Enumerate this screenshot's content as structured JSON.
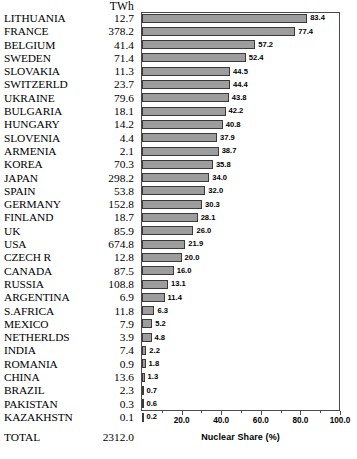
{
  "chart_data": {
    "type": "bar",
    "orientation": "horizontal",
    "title": "",
    "xlabel": "Nuclear Share (%)",
    "ylabel": "",
    "xlim": [
      0,
      100
    ],
    "xticks": [
      "20.0",
      "40.0",
      "60.0",
      "80.0",
      "100.0"
    ],
    "xtick_values": [
      20,
      40,
      60,
      80,
      100
    ],
    "grid": false,
    "legend": "none",
    "value_column_header": "TWh",
    "categories": [
      "LITHUANIA",
      "FRANCE",
      "BELGIUM",
      "SWEDEN",
      "SLOVAKIA",
      "SWITZERLD",
      "UKRAINE",
      "BULGARIA",
      "HUNGARY",
      "SLOVENIA",
      "ARMENIA",
      "KOREA",
      "JAPAN",
      "SPAIN",
      "GERMANY",
      "FINLAND",
      "UK",
      "USA",
      "CZECH  R",
      "CANADA",
      "RUSSIA",
      "ARGENTINA",
      "S.AFRICA",
      "MEXICO",
      "NETHERLDS",
      "INDIA",
      "ROMANIA",
      "CHINA",
      "BRAZIL",
      "PAKISTAN",
      "KAZAKHSTN"
    ],
    "twh": [
      "12.7",
      "378.2",
      "41.4",
      "71.4",
      "11.3",
      "23.7",
      "79.6",
      "18.1",
      "14.2",
      "4.4",
      "2.1",
      "70.3",
      "298.2",
      "53.8",
      "152.8",
      "18.7",
      "85.9",
      "674.8",
      "12.8",
      "87.5",
      "108.8",
      "6.9",
      "11.8",
      "7.9",
      "3.9",
      "7.4",
      "0.9",
      "13.6",
      "2.3",
      "0.3",
      "0.1"
    ],
    "twh_values": [
      12.7,
      378.2,
      41.4,
      71.4,
      11.3,
      23.7,
      79.6,
      18.1,
      14.2,
      4.4,
      2.1,
      70.3,
      298.2,
      53.8,
      152.8,
      18.7,
      85.9,
      674.8,
      12.8,
      87.5,
      108.8,
      6.9,
      11.8,
      7.9,
      3.9,
      7.4,
      0.9,
      13.6,
      2.3,
      0.3,
      0.1
    ],
    "values": [
      83.4,
      77.4,
      57.2,
      52.4,
      44.5,
      44.4,
      43.8,
      42.2,
      40.8,
      37.9,
      38.7,
      35.8,
      34.0,
      32.0,
      30.3,
      28.1,
      26.0,
      21.9,
      20.0,
      16.0,
      13.1,
      11.4,
      6.3,
      5.2,
      4.8,
      2.2,
      1.8,
      1.3,
      0.7,
      0.6,
      0.2
    ],
    "value_labels": [
      "83.4",
      "77.4",
      "57.2",
      "52.4",
      "44.5",
      "44.4",
      "43.8",
      "42.2",
      "40.8",
      "37.9",
      "38.7",
      "35.8",
      "34.0",
      "32.0",
      "30.3",
      "28.1",
      "26.0",
      "21.9",
      "20.0",
      "16.0",
      "13.1",
      "11.4",
      "6.3",
      "5.2",
      "4.8",
      "2.2",
      "1.8",
      "1.3",
      "0.7",
      "0.6",
      "0.2"
    ],
    "total_label": "TOTAL",
    "total_value": "2312.0",
    "bar_color": "#9d9d9d",
    "bar_border_color": "#3a3a3a",
    "axis_color": "#4a4a4a"
  }
}
